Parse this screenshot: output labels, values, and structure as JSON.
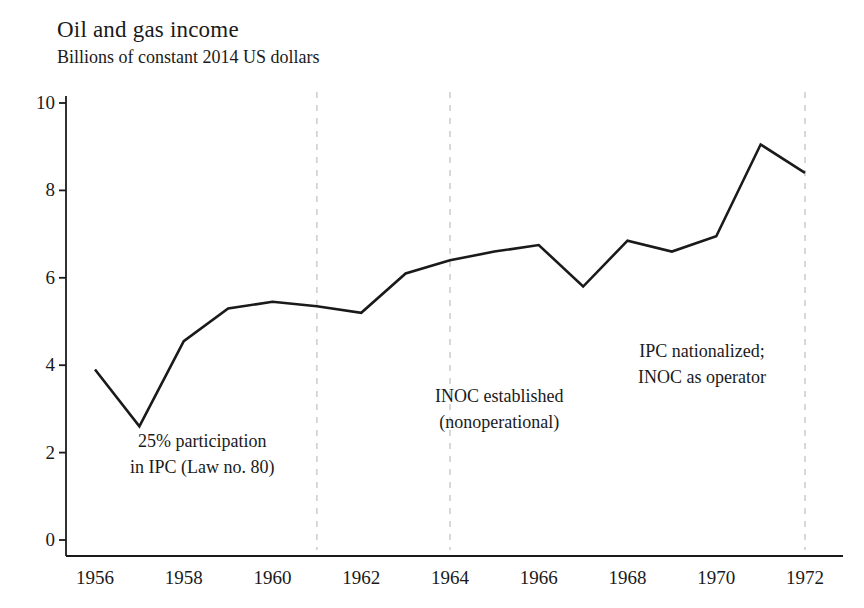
{
  "chart_data": {
    "type": "line",
    "title": "Oil and gas income",
    "subtitle": "Billions of constant 2014 US dollars",
    "xlabel": "",
    "ylabel": "",
    "xlim": [
      1955.6,
      1972.7
    ],
    "ylim": [
      0,
      10.6
    ],
    "grid": false,
    "legend": null,
    "x": [
      1956,
      1957,
      1958,
      1959,
      1960,
      1961,
      1962,
      1963,
      1964,
      1965,
      1966,
      1967,
      1968,
      1969,
      1970,
      1971,
      1972
    ],
    "values": [
      3.9,
      2.6,
      4.55,
      5.3,
      5.45,
      5.35,
      5.2,
      6.1,
      6.4,
      6.6,
      6.75,
      5.8,
      6.85,
      6.6,
      6.95,
      9.05,
      8.4
    ],
    "series": [
      {
        "name": "Oil and gas income",
        "values": [
          3.9,
          2.6,
          4.55,
          5.3,
          5.45,
          5.35,
          5.2,
          6.1,
          6.4,
          6.6,
          6.75,
          5.8,
          6.85,
          6.6,
          6.95,
          9.05,
          8.4
        ]
      }
    ],
    "ytick_labels": [
      "0",
      "2",
      "4",
      "6",
      "8",
      "10"
    ],
    "ytick_values": [
      0,
      2,
      4,
      6,
      8,
      10
    ],
    "xtick_labels": [
      "1956",
      "1958",
      "1960",
      "1962",
      "1964",
      "1966",
      "1968",
      "1970",
      "1972"
    ],
    "xtick_values": [
      1956,
      1958,
      1960,
      1962,
      1964,
      1966,
      1968,
      1970,
      1972
    ],
    "event_lines": [
      {
        "x": 1961,
        "label_line1": "25% participation",
        "label_line2": "in IPC (Law no. 80)"
      },
      {
        "x": 1964,
        "label_line1": "INOC established",
        "label_line2": "(nonoperational)"
      },
      {
        "x": 1972,
        "label_line1": "IPC nationalized;",
        "label_line2": "INOC as operator"
      }
    ],
    "line_color": "#1a1a1a",
    "axis_color": "#1a1a1a",
    "event_line_color": "#cfcfcf"
  },
  "annotations": [
    {
      "line1": "25% participation",
      "line2": "in IPC (Law no. 80)",
      "left": 130,
      "top": 428
    },
    {
      "line1": "INOC established",
      "line2": "(nonoperational)",
      "left": 435,
      "top": 383
    },
    {
      "line1": "IPC nationalized;",
      "line2": "INOC as operator",
      "left": 638,
      "top": 338
    }
  ]
}
